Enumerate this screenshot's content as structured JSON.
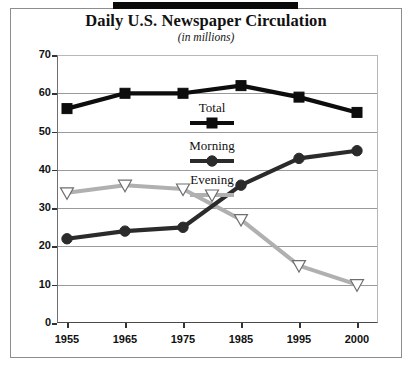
{
  "chart_data": {
    "type": "line",
    "title": "Daily U.S. Newspaper Circulation",
    "subtitle": "(in millions)",
    "xlabel": "",
    "ylabel": "",
    "categories": [
      "1955",
      "1965",
      "1975",
      "1985",
      "1995",
      "2000"
    ],
    "x_tick_labels": [
      "1955",
      "1965",
      "1975",
      "1985",
      "1995",
      "2000"
    ],
    "y_tick_labels": [
      "0",
      "10",
      "20",
      "30",
      "40",
      "50",
      "60",
      "70"
    ],
    "y_ticks": [
      0,
      10,
      20,
      30,
      40,
      50,
      60,
      70
    ],
    "ylim": [
      0,
      70
    ],
    "grid": true,
    "legend_position": "center",
    "series": [
      {
        "name": "Total",
        "marker": "square",
        "color": "#0d0d0d",
        "values": [
          56,
          60,
          60,
          62,
          59,
          55
        ]
      },
      {
        "name": "Morning",
        "marker": "circle",
        "color": "#2b2b2b",
        "values": [
          22,
          24,
          25,
          36,
          43,
          45
        ]
      },
      {
        "name": "Evening",
        "marker": "triangle-down-open",
        "color": "#b0b0b0",
        "values": [
          34,
          36,
          35,
          27,
          15,
          10
        ]
      }
    ]
  },
  "legend": {
    "items": [
      {
        "label": "Total",
        "marker": "square-marker"
      },
      {
        "label": "Morning",
        "marker": "circle-marker"
      },
      {
        "label": "Evening",
        "marker": "triangle-marker"
      }
    ]
  },
  "decor": {
    "top_rule": "black-rule"
  }
}
